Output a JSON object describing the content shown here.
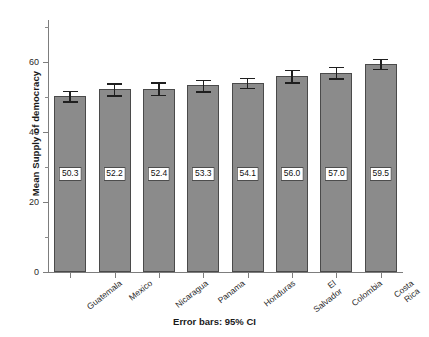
{
  "chart_data": {
    "type": "bar",
    "title": "",
    "subtitle": "",
    "xlabel": "Error bars: 95% CI",
    "ylabel": "Mean Supply of democracy",
    "categories": [
      "Guatemala",
      "Mexico",
      "Nicaragua",
      "Panama",
      "Honduras",
      "El\nSalvador",
      "Colombia",
      "Costa\nRica"
    ],
    "values": [
      50.3,
      52.2,
      52.4,
      53.3,
      54.1,
      56.0,
      57.0,
      59.5
    ],
    "value_labels": [
      "50.3",
      "52.2",
      "52.4",
      "53.3",
      "54.1",
      "56.0",
      "57.0",
      "59.5"
    ],
    "error_low": [
      48.8,
      50.5,
      50.6,
      51.6,
      52.7,
      54.2,
      55.3,
      58.1
    ],
    "error_high": [
      51.8,
      53.9,
      54.2,
      55.0,
      55.5,
      57.8,
      58.7,
      60.9
    ],
    "error_type": "95% CI",
    "ylim": [
      0,
      72
    ],
    "y_ticks_major": [
      0,
      20,
      40,
      60
    ],
    "y_ticks_major_labels": [
      "0",
      "20",
      "40",
      "60"
    ],
    "y_ticks_minor": [
      10,
      30,
      50,
      70
    ],
    "grid": false,
    "legend": "none",
    "bar_color": "#8b8b8b",
    "bar_edge_color": "#4a4a4a",
    "error_color": "#1f1f1f",
    "axis_color": "#7d7d7d",
    "background": "#ffffff"
  }
}
